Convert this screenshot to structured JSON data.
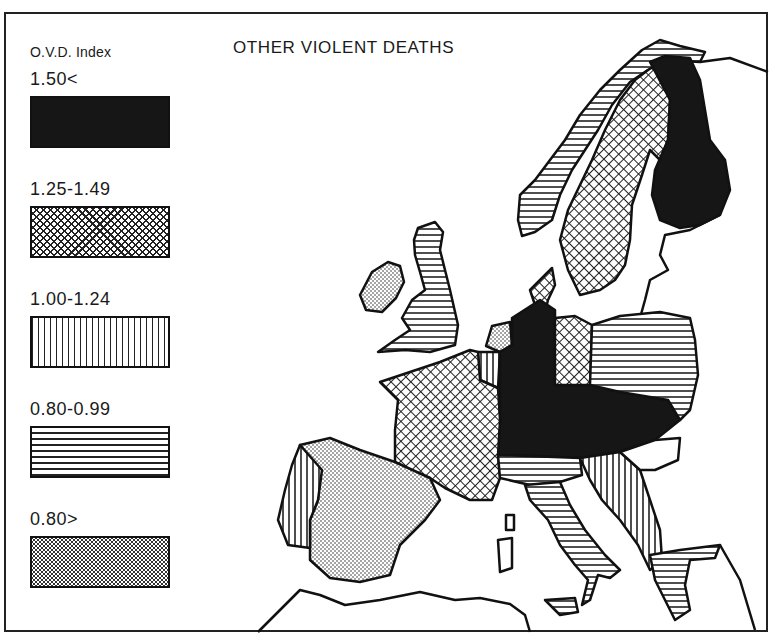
{
  "title": "OTHER VIOLENT DEATHS",
  "legend": {
    "title": "O.V.D. Index",
    "items": [
      {
        "label": "1.50<",
        "pattern": "solid-black"
      },
      {
        "label": "1.25-1.49",
        "pattern": "crosshatch"
      },
      {
        "label": "1.00-1.24",
        "pattern": "vertical-lines"
      },
      {
        "label": "0.80-0.99",
        "pattern": "horizontal-lines"
      },
      {
        "label": "0.80>",
        "pattern": "stipple"
      }
    ]
  },
  "map_regions": [
    {
      "region": "norway",
      "pattern": "horizontal-lines"
    },
    {
      "region": "sweden",
      "pattern": "crosshatch"
    },
    {
      "region": "finland",
      "pattern": "solid-black"
    },
    {
      "region": "denmark",
      "pattern": "crosshatch"
    },
    {
      "region": "great-britain",
      "pattern": "horizontal-lines"
    },
    {
      "region": "ireland",
      "pattern": "stipple"
    },
    {
      "region": "netherlands",
      "pattern": "stipple"
    },
    {
      "region": "belgium",
      "pattern": "vertical-lines"
    },
    {
      "region": "west-germany",
      "pattern": "solid-black"
    },
    {
      "region": "east-germany",
      "pattern": "crosshatch"
    },
    {
      "region": "poland",
      "pattern": "horizontal-lines"
    },
    {
      "region": "czechoslovakia-austria-hungary",
      "pattern": "solid-black"
    },
    {
      "region": "france",
      "pattern": "crosshatch"
    },
    {
      "region": "spain",
      "pattern": "stipple"
    },
    {
      "region": "portugal",
      "pattern": "vertical-lines"
    },
    {
      "region": "switzerland-italy-north",
      "pattern": "horizontal-lines"
    },
    {
      "region": "italy",
      "pattern": "horizontal-lines"
    },
    {
      "region": "yugoslavia",
      "pattern": "vertical-lines"
    },
    {
      "region": "greece",
      "pattern": "horizontal-lines"
    },
    {
      "region": "romania",
      "pattern": "none"
    }
  ]
}
